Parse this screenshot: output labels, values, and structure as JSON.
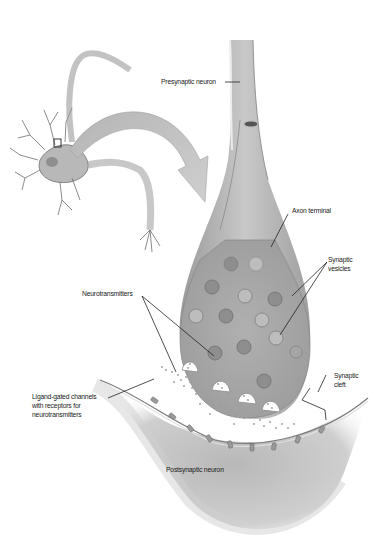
{
  "diagram": {
    "type": "anatomical illustration",
    "labels": {
      "presynaptic_neuron": "Presynaptic neuron",
      "axon_terminal": "Axon terminal",
      "synaptic_vesicles_line1": "Synaptic",
      "synaptic_vesicles_line2": "vesicles",
      "neurotransmitters": "Neurotransmitters",
      "synaptic_cleft_line1": "Synaptic",
      "synaptic_cleft_line2": "cleft",
      "ligand_channels_line1": "Ligand-gated channels",
      "ligand_channels_line2": "with receptors for",
      "ligand_channels_line3": "neurotransmitters",
      "postsynaptic_neuron": "Postsynaptic neuron"
    },
    "colors": {
      "membrane_fill": "#a9a9a9",
      "membrane_light": "#d6d6d6",
      "vesicle": "#8c8c8c",
      "background": "#ffffff",
      "label_text": "#222222"
    }
  }
}
